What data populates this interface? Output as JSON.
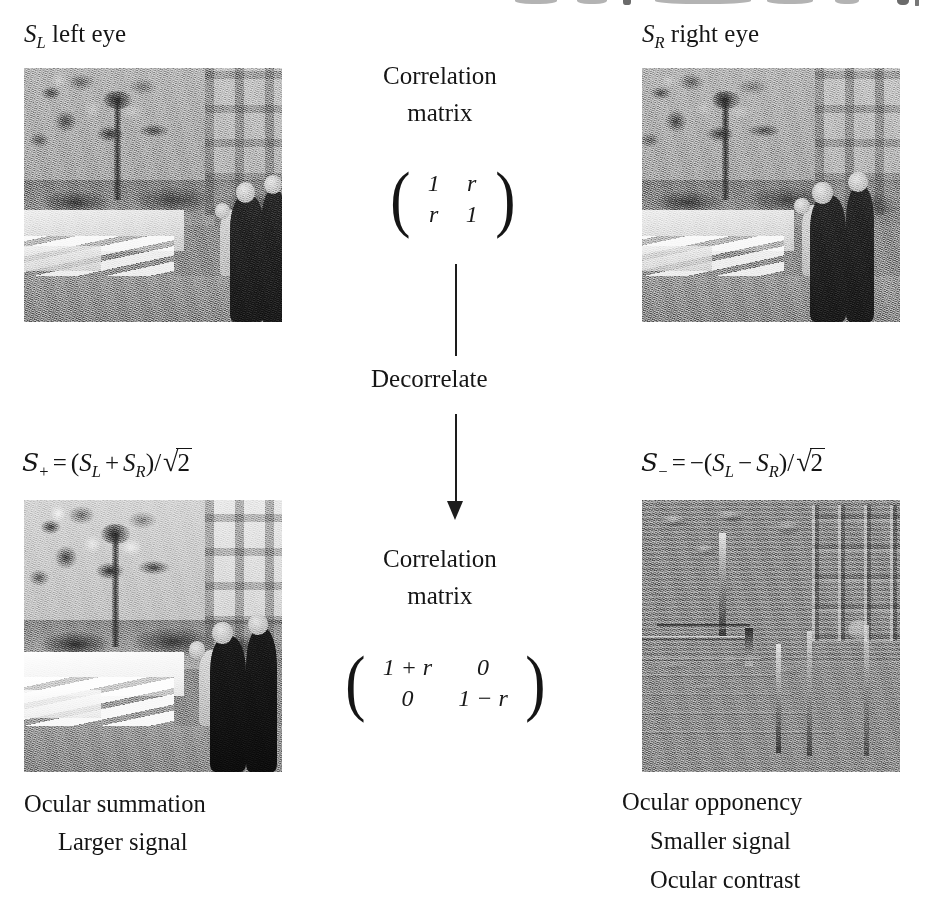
{
  "figure": {
    "title_fragment": "",
    "labels": {
      "left_eye": {
        "symbol": "S",
        "subscript": "L",
        "text": "left eye"
      },
      "right_eye": {
        "symbol": "S",
        "subscript": "R",
        "text": "right eye"
      }
    },
    "center": {
      "correlation_top": {
        "line1": "Correlation",
        "line2": "matrix"
      },
      "correlation_bottom": {
        "line1": "Correlation",
        "line2": "matrix"
      },
      "decorrelate": "Decorrelate",
      "matrix_top": {
        "rows": [
          [
            "1",
            "r"
          ],
          [
            "r",
            "1"
          ]
        ],
        "left_bracket": "(",
        "right_bracket": ")"
      },
      "matrix_bottom": {
        "rows": [
          [
            "1 + r",
            "0"
          ],
          [
            "0",
            "1 − r"
          ]
        ],
        "left_bracket": "(",
        "right_bracket": ")"
      }
    },
    "formulas": {
      "summation": {
        "lhs_symbol": "S",
        "lhs_subscript": "+",
        "equals": "=",
        "open_paren": "(",
        "term1": "S",
        "term1_sub": "L",
        "operator": "+",
        "term2": "S",
        "term2_sub": "R",
        "close_paren": ")",
        "divide": "/",
        "radical": "√",
        "radicand": "2"
      },
      "opponency": {
        "lhs_symbol": "S",
        "lhs_subscript": "−",
        "equals": "=",
        "negate": "−",
        "open_paren": "(",
        "term1": "S",
        "term1_sub": "L",
        "operator": "−",
        "term2": "S",
        "term2_sub": "R",
        "close_paren": ")",
        "divide": "/",
        "radical": "√",
        "radicand": "2"
      }
    },
    "captions": {
      "left": [
        "Ocular summation",
        "Larger signal"
      ],
      "right": [
        "Ocular opponency",
        "Smaller signal",
        "Ocular contrast"
      ]
    },
    "photos": {
      "left_eye": {
        "alt": "noisy grayscale street scene, left eye view"
      },
      "right_eye": {
        "alt": "noisy grayscale street scene, right eye view"
      },
      "summation": {
        "alt": "high contrast summed stereo image"
      },
      "opponency": {
        "alt": "mid-gray embossed difference image"
      }
    },
    "colors": {
      "ink": "#151515",
      "background": "#ffffff",
      "arrow": "#1d1d1d",
      "photo_mid_gray": "#8f8f8f"
    }
  }
}
